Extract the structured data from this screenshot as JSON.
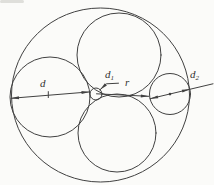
{
  "diagram": {
    "type": "tangent-circles-dimension-figure",
    "background": "#fbfbf9",
    "stroke": "#414141",
    "labels": {
      "d": "d",
      "d1": {
        "base": "d",
        "sub": "1"
      },
      "r": "r",
      "d2": {
        "base": "d",
        "sub": "2"
      }
    },
    "geometry": {
      "viewbox": "0 0 214 185",
      "circles": [
        {
          "name": "outer-circle",
          "cx": 100.5,
          "cy": 95,
          "rx": 89,
          "ry": 87
        },
        {
          "name": "left-circle",
          "cx": 50,
          "cy": 97,
          "r": 40
        },
        {
          "name": "top-circle",
          "cx": 119,
          "cy": 55,
          "r": 42
        },
        {
          "name": "bottom-circle",
          "cx": 117,
          "cy": 133,
          "r": 39
        },
        {
          "name": "right-circle",
          "cx": 170,
          "cy": 94,
          "r": 20.5
        },
        {
          "name": "small-circle",
          "cx": 96,
          "cy": 94,
          "r": 6
        }
      ],
      "lines": [
        {
          "name": "d-dimension-line",
          "points": [
            [
              11,
              98.3
            ],
            [
              89.5,
              91.9
            ]
          ]
        },
        {
          "name": "d-center-tick",
          "points": [
            [
              48.3,
              91.6
            ],
            [
              48.3,
              97.6
            ]
          ]
        },
        {
          "name": "d1-leader-line",
          "points": [
            [
              100,
              89.8
            ],
            [
              106.5,
              83.8
            ],
            [
              118.5,
              83.2
            ]
          ]
        },
        {
          "name": "r-dimension-line",
          "points": [
            [
              96.5,
              93.8
            ],
            [
              148.8,
              96.3
            ]
          ]
        },
        {
          "name": "d2-dimension-line",
          "points": [
            [
              150.1,
              98.7
            ],
            [
              213,
              83.8
            ]
          ]
        }
      ],
      "arrows": [
        {
          "name": "d-arrow-left",
          "tip": [
            11,
            98.3
          ],
          "angle": 175.3
        },
        {
          "name": "d-arrow-right",
          "tip": [
            89.5,
            91.9
          ],
          "angle": -4.7
        },
        {
          "name": "d1-arrow",
          "tip": [
            100,
            89.8
          ],
          "angle": 137.3
        },
        {
          "name": "r-arrow",
          "tip": [
            148.8,
            96.3
          ],
          "angle": 2.7
        },
        {
          "name": "d2-arrow-left",
          "tip": [
            150.1,
            98.7
          ],
          "angle": 166.7
        },
        {
          "name": "d2-arrow-right",
          "tip": [
            189.9,
            89.3
          ],
          "angle": -13.3
        }
      ],
      "dots": [
        {
          "name": "right-circle-center-dot",
          "cx": 170,
          "cy": 94.1,
          "r": 1.3
        }
      ]
    }
  }
}
